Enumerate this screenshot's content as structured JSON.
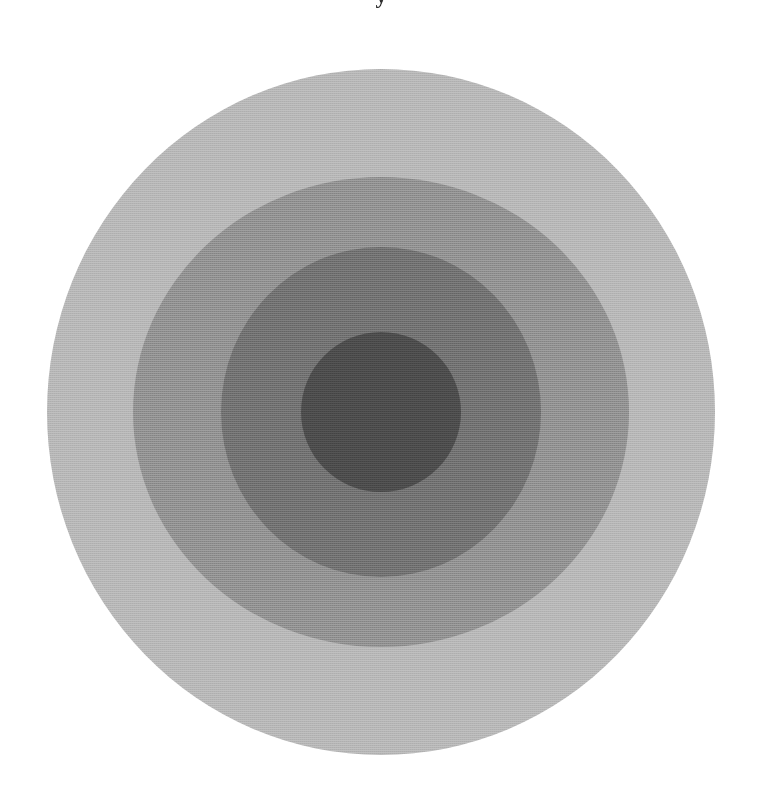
{
  "figure": {
    "background_color": "#ffffff",
    "width": 763,
    "height": 793,
    "clipped_caption": "y",
    "caption_color": "#2b2b2b"
  },
  "chart_data": {
    "type": "pie",
    "title": "",
    "subtitle": "",
    "xlabel": "",
    "ylabel": "",
    "grid": false,
    "legend_position": "none",
    "center": {
      "x": 381,
      "y": 412
    },
    "categories": [
      "Outer ring",
      "Ring 2",
      "Ring 3",
      "Inner disc"
    ],
    "values": [
      334,
      248,
      160,
      80
    ],
    "series": [
      {
        "name": "Radius (px)",
        "values": [
          334,
          248,
          160,
          80
        ]
      },
      {
        "name": "Fill gray level (0-255)",
        "values": [
          181,
          142,
          110,
          74
        ]
      }
    ],
    "rings": [
      {
        "label": "Outer ring",
        "order": 1,
        "radius_x": 334,
        "radius_y": 343,
        "fill": "#b5b5b5",
        "gray_level": 181
      },
      {
        "label": "Ring 2",
        "order": 2,
        "radius_x": 248,
        "radius_y": 235,
        "fill": "#8e8e8e",
        "gray_level": 142
      },
      {
        "label": "Ring 3",
        "order": 3,
        "radius_x": 160,
        "radius_y": 165,
        "fill": "#6e6e6e",
        "gray_level": 110
      },
      {
        "label": "Inner disc",
        "order": 4,
        "radius_x": 80,
        "radius_y": 80,
        "fill": "#4a4a4a",
        "gray_level": 74
      }
    ]
  }
}
